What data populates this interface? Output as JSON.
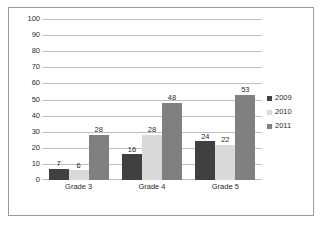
{
  "chart_data": {
    "type": "bar",
    "title": "",
    "subtitle": "",
    "xlabel": "",
    "ylabel": "",
    "categories": [
      "Grade 3",
      "Grade 4",
      "Grade 5"
    ],
    "series": [
      {
        "name": "2009",
        "values": [
          7,
          16,
          24
        ],
        "color": "#404040"
      },
      {
        "name": "2010",
        "values": [
          6,
          28,
          22
        ],
        "color": "#d9d9d9"
      },
      {
        "name": "2011",
        "values": [
          28,
          48,
          53
        ],
        "color": "#808080"
      }
    ],
    "ylim": [
      0,
      100
    ],
    "ytick_step": 10,
    "yticks": [
      0,
      10,
      20,
      30,
      40,
      50,
      60,
      70,
      80,
      90,
      100
    ],
    "ytick_labels": [
      "0",
      "10",
      "20",
      "30",
      "40",
      "50",
      "60",
      "70",
      "80",
      "90",
      "100"
    ],
    "data_labels_visible": true,
    "grid": {
      "horizontal": true,
      "vertical": false,
      "color": "#bfbfbf"
    },
    "legend": {
      "visible": true,
      "position": "right",
      "entries": [
        "2009",
        "2010",
        "2011"
      ]
    },
    "plot_background": "#ffffff",
    "border_color": "#9a9a9a"
  }
}
